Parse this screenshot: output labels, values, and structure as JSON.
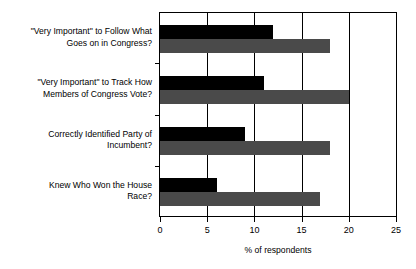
{
  "chart_data": {
    "type": "bar",
    "orientation": "horizontal",
    "title": "",
    "xlabel": "% of respondents",
    "ylabel": "",
    "xlim": [
      0,
      25
    ],
    "xticks": [
      0,
      5,
      10,
      15,
      20,
      25
    ],
    "xtick_labels": [
      "0",
      "5",
      "10",
      "15",
      "20",
      "25"
    ],
    "grid": true,
    "legend": null,
    "categories": [
      "\"Very Important\" to Follow What\nGoes on in Congress?",
      "\"Very Important\" to Track How\nMembers of Congress Vote?",
      "Correctly Identified Party of\nIncumbent?",
      "Knew Who Won the House\nRace?"
    ],
    "series": [
      {
        "name": "series-1",
        "color": "#000000",
        "values": [
          12,
          11,
          9,
          6
        ]
      },
      {
        "name": "series-2",
        "color": "#4a4a4a",
        "values": [
          18,
          20,
          18,
          17
        ]
      }
    ]
  },
  "axis": {
    "title": "% of respondents"
  }
}
